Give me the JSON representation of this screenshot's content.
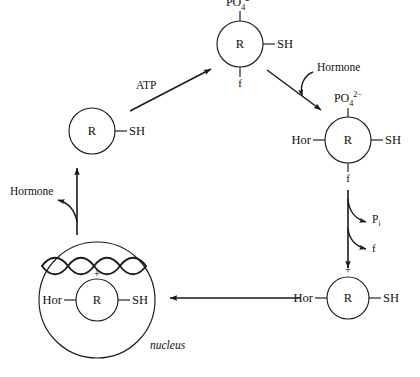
{
  "diagram": {
    "nucleus_label": "nucleus",
    "stroke_color": "#1a1a1a"
  },
  "nodes": {
    "receptor_free": {
      "center": "R",
      "right": "SH",
      "name": "receptor-unphosphorylated"
    },
    "receptor_phosphorylated": {
      "center": "R",
      "right": "SH",
      "top": "PO4",
      "top_charge": "2−",
      "bottom": "f",
      "name": "receptor-phosphorylated"
    },
    "receptor_hormone_phos": {
      "center": "R",
      "left": "Hor",
      "right": "SH",
      "top": "PO4",
      "top_charge": "2−",
      "bottom": "f",
      "name": "receptor-hormone-phosphorylated"
    },
    "receptor_hormone_active": {
      "center": "R",
      "left": "Hor",
      "right": "SH",
      "top": "+",
      "name": "receptor-hormone-activated"
    },
    "receptor_nuclear": {
      "center": "R",
      "left": "Hor",
      "right": "SH",
      "top": "+",
      "name": "receptor-nuclear-bound"
    }
  },
  "annotations": {
    "atp": "ATP",
    "hormone_binding": "Hormone",
    "hormone_release": "Hormone",
    "phosphate_released": "P",
    "phosphate_sub": "i",
    "factor_released": "f"
  }
}
